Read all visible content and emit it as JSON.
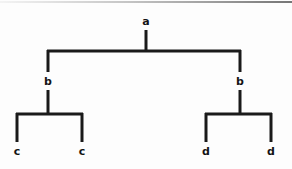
{
  "diagram": {
    "type": "tree",
    "line_color": "#1a1a1a",
    "label_color": "#141414",
    "background_color": "#fdfdfd",
    "top_rule_color": "#8e8e8e",
    "line_width": 3,
    "depth": 3,
    "nodes": [
      {
        "id": "root",
        "label": "a",
        "level": 0,
        "x": 146,
        "y": 22
      },
      {
        "id": "b-left",
        "label": "b",
        "level": 1,
        "x": 48,
        "y": 82
      },
      {
        "id": "b-right",
        "label": "b",
        "level": 1,
        "x": 240,
        "y": 82
      },
      {
        "id": "c-left",
        "label": "c",
        "level": 2,
        "x": 17,
        "y": 152
      },
      {
        "id": "c-right",
        "label": "c",
        "level": 2,
        "x": 82,
        "y": 152
      },
      {
        "id": "d-left",
        "label": "d",
        "level": 2,
        "x": 206,
        "y": 152
      },
      {
        "id": "d-right",
        "label": "d",
        "level": 2,
        "x": 271,
        "y": 152
      }
    ],
    "edges": [
      {
        "from": "root",
        "to": "b-left"
      },
      {
        "from": "root",
        "to": "b-right"
      },
      {
        "from": "b-left",
        "to": "c-left"
      },
      {
        "from": "b-left",
        "to": "c-right"
      },
      {
        "from": "b-right",
        "to": "d-left"
      },
      {
        "from": "b-right",
        "to": "d-right"
      }
    ],
    "geometry": {
      "root_stem_top": 30,
      "root_stem_bottom": 52,
      "level1_bar_y": 51,
      "level1_bar_left_x": 48,
      "level1_bar_right_x": 240,
      "level1_drop_top": 51,
      "level1_drop_bottom": 72,
      "level2_stem_top": 90,
      "level2_stem_bottom": 115,
      "level2_bar_y": 114,
      "left_group_bar_left_x": 17,
      "left_group_bar_right_x": 82,
      "right_group_bar_left_x": 206,
      "right_group_bar_right_x": 271,
      "leaf_drop_top": 114,
      "leaf_drop_bottom": 142
    }
  }
}
